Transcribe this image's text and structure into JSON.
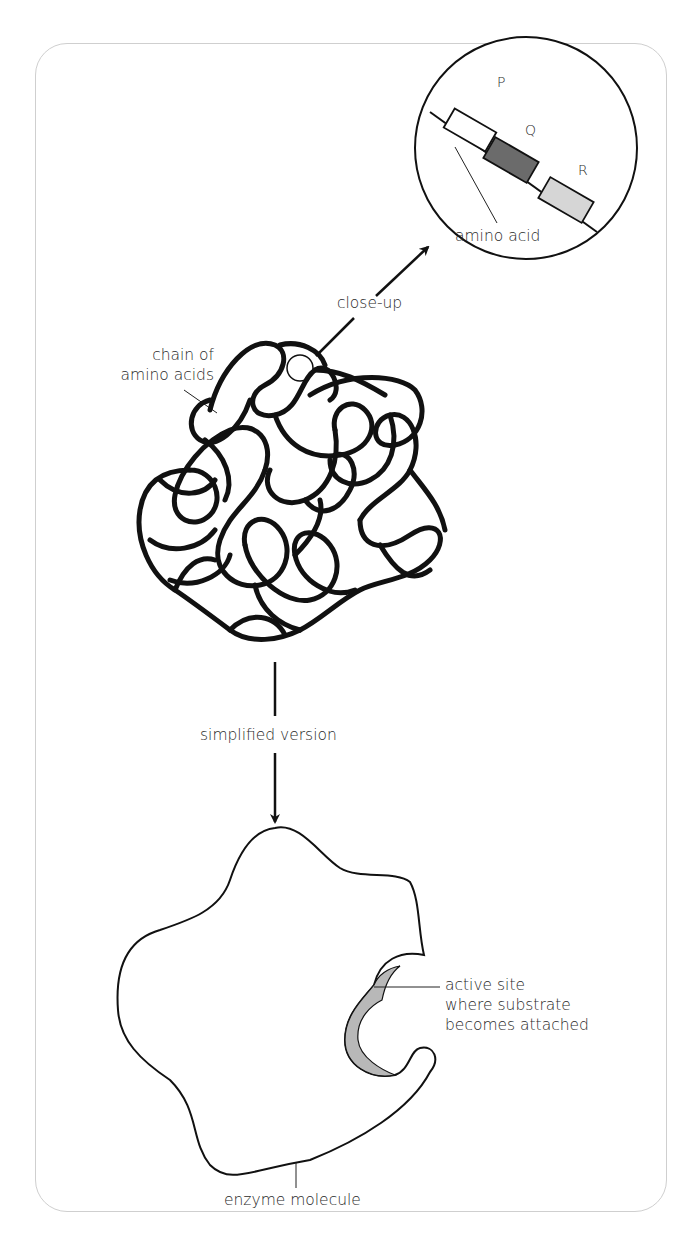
{
  "diagram": {
    "labels": {
      "close_up": "close-up",
      "chain_of_amino_acids": "chain of\namino acids",
      "simplified_version": "simplified version",
      "active_site": "active site\nwhere substrate\nbecomes attached",
      "enzyme_molecule": "enzyme molecule",
      "amino_acid": "amino acid",
      "block_p": "P",
      "block_q": "Q",
      "block_r": "R"
    },
    "colors": {
      "line": "#111111",
      "frame": "#cfcfcf",
      "block_p": "#ffffff",
      "block_q": "#6b6b6b",
      "block_r": "#d6d6d6",
      "active_site_fill": "#b8b8b8"
    },
    "nodes": [
      {
        "id": "chain",
        "description": "tangled chain of amino acids (protein)"
      },
      {
        "id": "closeup-circle",
        "description": "magnified view of three amino acids P, Q, R"
      },
      {
        "id": "enzyme",
        "description": "simplified enzyme molecule outline with active site"
      }
    ],
    "edges": [
      {
        "from": "chain",
        "to": "closeup-circle",
        "label": "close-up"
      },
      {
        "from": "chain",
        "to": "enzyme",
        "label": "simplified version"
      }
    ]
  }
}
